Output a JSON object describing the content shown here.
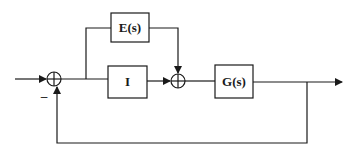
{
  "diagram": {
    "type": "block-diagram",
    "blocks": [
      {
        "id": "E",
        "label": "E(s)"
      },
      {
        "id": "I",
        "label": "I"
      },
      {
        "id": "G",
        "label": "G(s)"
      }
    ],
    "junctions": [
      {
        "id": "sum1",
        "signs": {
          "input": "+",
          "feedback": "-"
        },
        "minus_label": "–"
      },
      {
        "id": "sum2",
        "signs": {
          "from_I": "+",
          "from_E": "+"
        }
      }
    ],
    "connections": [
      {
        "from": "input",
        "to": "sum1"
      },
      {
        "from": "sum1",
        "to": "I"
      },
      {
        "from": "sum1",
        "to": "E"
      },
      {
        "from": "I",
        "to": "sum2"
      },
      {
        "from": "E",
        "to": "sum2"
      },
      {
        "from": "sum2",
        "to": "G"
      },
      {
        "from": "G",
        "to": "output"
      },
      {
        "from": "output",
        "to": "sum1",
        "kind": "negative feedback"
      }
    ],
    "colors": {
      "stroke": "#1a1a1a",
      "background": "#ffffff"
    }
  }
}
